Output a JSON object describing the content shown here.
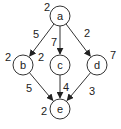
{
  "graph": {
    "nodes": [
      {
        "id": "a",
        "label": "a",
        "weight": "2",
        "cx": 60,
        "cy": 16,
        "wx": 47,
        "wy": 7
      },
      {
        "id": "b",
        "label": "b",
        "weight": "2",
        "cx": 23,
        "cy": 65,
        "wx": 8,
        "wy": 57
      },
      {
        "id": "c",
        "label": "c",
        "weight": "2",
        "cx": 60,
        "cy": 65,
        "wx": 41,
        "wy": 57
      },
      {
        "id": "d",
        "label": "d",
        "weight": "7",
        "cx": 97,
        "cy": 65,
        "wx": 113,
        "wy": 55
      },
      {
        "id": "e",
        "label": "e",
        "weight": "2",
        "cx": 60,
        "cy": 109,
        "wx": 44,
        "wy": 111
      }
    ],
    "edges": [
      {
        "from": "a",
        "to": "b",
        "weight": "5",
        "lx": 36,
        "ly": 34
      },
      {
        "from": "a",
        "to": "c",
        "weight": "7",
        "lx": 54,
        "ly": 42
      },
      {
        "from": "a",
        "to": "d",
        "weight": "2",
        "lx": 87,
        "ly": 33
      },
      {
        "from": "b",
        "to": "e",
        "weight": "5",
        "lx": 29,
        "ly": 88
      },
      {
        "from": "c",
        "to": "e",
        "weight": "4",
        "lx": 66,
        "ly": 87
      },
      {
        "from": "d",
        "to": "e",
        "weight": "3",
        "lx": 92,
        "ly": 91
      }
    ]
  }
}
